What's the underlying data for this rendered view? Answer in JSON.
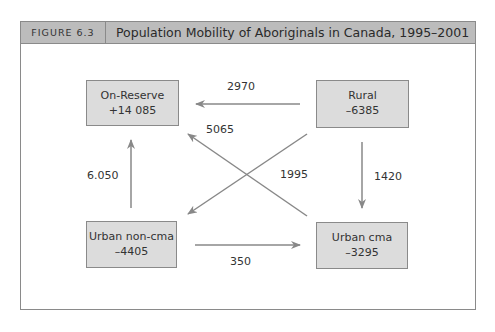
{
  "figure": {
    "label": "FIGURE 6.3",
    "title": "Population Mobility of Aboriginals in Canada, 1995–2001"
  },
  "nodes": {
    "on_reserve": {
      "name": "On-Reserve",
      "net": "+14 085"
    },
    "rural": {
      "name": "Rural",
      "net": "–6385"
    },
    "urban_non_cma": {
      "name": "Urban non-cma",
      "net": "–4405"
    },
    "urban_cma": {
      "name": "Urban cma",
      "net": "–3295"
    }
  },
  "flows": {
    "rural_to_on_reserve": "2970",
    "urban_cma_to_on_reserve": "5065",
    "rural_to_urban_non_cma": "1995",
    "urban_non_cma_to_on_reserve": "6.050",
    "rural_to_urban_cma": "1420",
    "urban_non_cma_to_urban_cma": "350"
  },
  "colors": {
    "header_bg": "#bcbcbc",
    "node_bg": "#dcdcdc",
    "arrow": "#888888",
    "border": "#8a8a8a"
  }
}
